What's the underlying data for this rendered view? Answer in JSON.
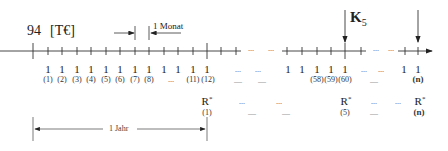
{
  "header": {
    "amount_label": "94",
    "unit_label": "[T€]",
    "month_label": "1 Monat",
    "k_label": "K",
    "k_subscript": "5",
    "year_label": "1 Jahr"
  },
  "timeline": {
    "payments": [
      {
        "value": "1",
        "index": "(1)"
      },
      {
        "value": "1",
        "index": "(2)"
      },
      {
        "value": "1",
        "index": "(3)"
      },
      {
        "value": "1",
        "index": "(4)"
      },
      {
        "value": "1",
        "index": "(5)"
      },
      {
        "value": "1",
        "index": "(6)"
      },
      {
        "value": "1",
        "index": "(7)"
      },
      {
        "value": "1",
        "index": "(8)"
      },
      {
        "value": "1",
        "index": "..."
      },
      {
        "value": "1",
        "index": ""
      },
      {
        "value": "1",
        "index": "(11)"
      },
      {
        "value": "1",
        "index": "(12)"
      }
    ],
    "payments_late": [
      {
        "value": "1",
        "index": ""
      },
      {
        "value": "1",
        "index": "(58)"
      },
      {
        "value": "1",
        "index": "(59)"
      },
      {
        "value": "1",
        "index": "(60)"
      },
      {
        "value": "1",
        "index": ""
      },
      {
        "value": "1",
        "index": "(n)"
      }
    ],
    "ellipsis": "...",
    "dash": "—"
  },
  "annuities": {
    "symbol": "R",
    "star": "*",
    "items": [
      {
        "index": "(1)"
      },
      {
        "index": "(5)"
      },
      {
        "index": "(n)"
      }
    ]
  }
}
